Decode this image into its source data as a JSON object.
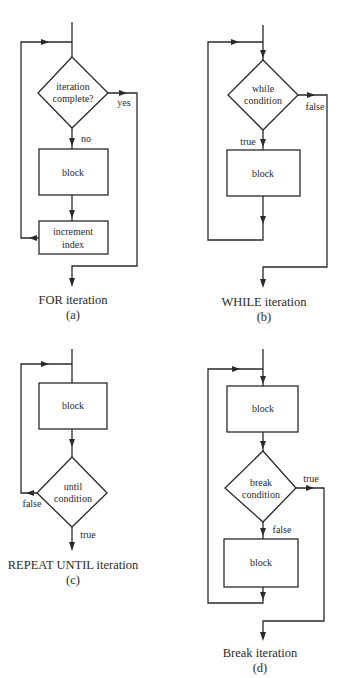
{
  "diagrams": {
    "a": {
      "decision": [
        "iteration",
        "complete?"
      ],
      "yes_label": "yes",
      "no_label": "no",
      "block": "block",
      "increment": [
        "increment",
        "index"
      ],
      "caption": "FOR iteration",
      "sub": "(a)"
    },
    "b": {
      "decision": [
        "while",
        "condition"
      ],
      "true_label": "true",
      "false_label": "false",
      "block": "block",
      "caption": "WHILE iteration",
      "sub": "(b)"
    },
    "c": {
      "block": "block",
      "decision": [
        "until",
        "condition"
      ],
      "true_label": "true",
      "false_label": "false",
      "caption": "REPEAT UNTIL iteration",
      "sub": "(c)"
    },
    "d": {
      "block1": "block",
      "decision": [
        "break",
        "condition"
      ],
      "true_label": "true",
      "false_label": "false",
      "block2": "block",
      "caption": "Break iteration",
      "sub": "(d)"
    }
  }
}
